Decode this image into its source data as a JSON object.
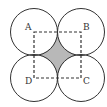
{
  "diagram": {
    "type": "geometry",
    "points": [
      {
        "label": "A",
        "x": 34,
        "y": 32
      },
      {
        "label": "B",
        "x": 81,
        "y": 32
      },
      {
        "label": "C",
        "x": 81,
        "y": 78
      },
      {
        "label": "D",
        "x": 34,
        "y": 78
      }
    ],
    "radius": 23.5,
    "square_style": "dashed",
    "shade_color": "#b8b8b8",
    "stroke_color": "#333333"
  }
}
